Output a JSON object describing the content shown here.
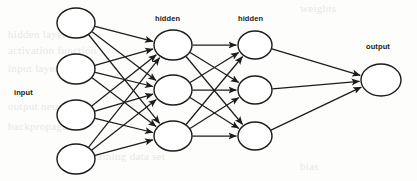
{
  "diagram": {
    "background_color": "#fdfdfc",
    "stroke_color": "#1c1c1c",
    "node_fill": "#ffffff",
    "labels": {
      "input": "input",
      "hidden_1": "hidden",
      "hidden_2": "hidden",
      "output": "output"
    },
    "layers": [
      {
        "id": "input",
        "label": "input",
        "label_position": {
          "x": 14,
          "y": 88
        },
        "node_count": 4,
        "nodes": [
          {
            "cx": 76,
            "cy": 23,
            "rx": 19,
            "ry": 15
          },
          {
            "cx": 76,
            "cy": 69,
            "rx": 19,
            "ry": 15
          },
          {
            "cx": 76,
            "cy": 115,
            "rx": 19,
            "ry": 15
          },
          {
            "cx": 76,
            "cy": 159,
            "rx": 19,
            "ry": 15
          }
        ]
      },
      {
        "id": "hidden-1",
        "label": "hidden",
        "label_position": {
          "x": 155,
          "y": 14
        },
        "node_count": 3,
        "nodes": [
          {
            "cx": 173,
            "cy": 45,
            "rx": 19,
            "ry": 15
          },
          {
            "cx": 173,
            "cy": 90,
            "rx": 19,
            "ry": 15
          },
          {
            "cx": 173,
            "cy": 136,
            "rx": 19,
            "ry": 15
          }
        ]
      },
      {
        "id": "hidden-2",
        "label": "hidden",
        "label_position": {
          "x": 238,
          "y": 14
        },
        "node_count": 3,
        "nodes": [
          {
            "cx": 255,
            "cy": 45,
            "rx": 17,
            "ry": 14
          },
          {
            "cx": 255,
            "cy": 90,
            "rx": 17,
            "ry": 14
          },
          {
            "cx": 255,
            "cy": 136,
            "rx": 17,
            "ry": 14
          }
        ]
      },
      {
        "id": "output",
        "label": "output",
        "label_position": {
          "x": 366,
          "y": 42
        },
        "node_count": 1,
        "nodes": [
          {
            "cx": 381,
            "cy": 80,
            "rx": 20,
            "ry": 16
          }
        ]
      }
    ],
    "connections": [
      {
        "from": "input",
        "to": "hidden-1",
        "pattern": "fully-connected",
        "count": 12,
        "directed": true
      },
      {
        "from": "hidden-1",
        "to": "hidden-2",
        "pattern": "fully-connected",
        "count": 9,
        "directed": true
      },
      {
        "from": "hidden-2",
        "to": "output",
        "pattern": "fully-connected",
        "count": 3,
        "directed": true
      }
    ]
  },
  "background_bleed": [
    {
      "text": "weights",
      "x": 300,
      "y": 2
    },
    {
      "text": "hidden layer",
      "x": 8,
      "y": 28
    },
    {
      "text": "activation function",
      "x": 8,
      "y": 44
    },
    {
      "text": "input layer",
      "x": 8,
      "y": 62
    },
    {
      "text": "output neuron",
      "x": 8,
      "y": 100
    },
    {
      "text": "backpropagation",
      "x": 8,
      "y": 120
    },
    {
      "text": "training data set",
      "x": 90,
      "y": 150
    },
    {
      "text": "bias",
      "x": 300,
      "y": 160
    }
  ]
}
